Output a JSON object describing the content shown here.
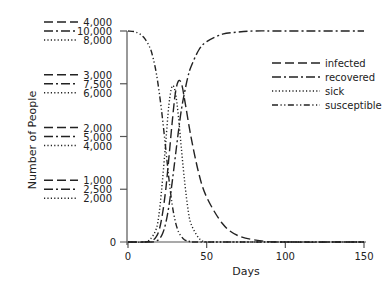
{
  "chart_data": {
    "type": "line",
    "title": "",
    "xlabel": "Days",
    "ylabel": "Number of People",
    "xlim": [
      0,
      150
    ],
    "x_ticks": [
      0,
      50,
      100,
      150
    ],
    "grid": false,
    "legend_position": "upper right (inside plot)",
    "y_scales": [
      {
        "series": "infected",
        "ticks": [
          "0",
          "1,000",
          "2,000",
          "3,000",
          "4,000"
        ],
        "max": 4000
      },
      {
        "series": "recovered / susceptible",
        "ticks": [
          "0",
          "2,500",
          "5,000",
          "7,500",
          "10,000"
        ],
        "max": 10000
      },
      {
        "series": "sick",
        "ticks": [
          "0",
          "2,000",
          "4,000",
          "6,000",
          "8,000"
        ],
        "max": 8000
      }
    ],
    "y_tick_groups": [
      {
        "infected": "4,000",
        "recovered_susceptible": "10,000",
        "sick": "8,000"
      },
      {
        "infected": "3,000",
        "recovered_susceptible": "7,500",
        "sick": "6,000"
      },
      {
        "infected": "2,000",
        "recovered_susceptible": "5,000",
        "sick": "4,000"
      },
      {
        "infected": "1,000",
        "recovered_susceptible": "2,500",
        "sick": "2,000"
      }
    ],
    "zero_label": "0",
    "series": [
      {
        "name": "infected",
        "style": "long-dash",
        "scale_max": 4000,
        "x": [
          0,
          10,
          15,
          18,
          20,
          22,
          24,
          26,
          28,
          30,
          32,
          34,
          36,
          40,
          45,
          50,
          60,
          70,
          85,
          100,
          150
        ],
        "values": [
          0,
          0,
          20,
          100,
          250,
          550,
          1000,
          1600,
          2250,
          2800,
          3050,
          3000,
          2700,
          2000,
          1300,
          850,
          350,
          120,
          20,
          0,
          0
        ]
      },
      {
        "name": "recovered",
        "style": "dash-dot",
        "scale_max": 10000,
        "x": [
          0,
          15,
          18,
          20,
          22,
          24,
          26,
          28,
          30,
          32,
          34,
          36,
          38,
          40,
          45,
          50,
          60,
          70,
          80,
          100,
          150
        ],
        "values": [
          0,
          0,
          50,
          150,
          400,
          900,
          1700,
          2800,
          4000,
          5200,
          6300,
          7100,
          7800,
          8300,
          9100,
          9500,
          9850,
          9950,
          10000,
          10000,
          10000
        ]
      },
      {
        "name": "sick",
        "style": "dotted",
        "scale_max": 8000,
        "x": [
          0,
          10,
          14,
          18,
          20,
          22,
          24,
          26,
          28,
          30,
          32,
          34,
          36,
          38,
          40,
          45,
          50,
          60,
          150
        ],
        "values": [
          0,
          0,
          100,
          500,
          1200,
          2400,
          3800,
          5200,
          5900,
          5700,
          4800,
          3500,
          2300,
          1300,
          700,
          150,
          0,
          0,
          0
        ]
      },
      {
        "name": "susceptible",
        "style": "dash-dot-dot",
        "scale_max": 10000,
        "x": [
          0,
          5,
          10,
          14,
          16,
          18,
          20,
          22,
          24,
          26,
          28,
          30,
          32,
          34,
          36,
          40,
          50,
          150
        ],
        "values": [
          10000,
          9950,
          9700,
          9200,
          8700,
          8000,
          7000,
          5800,
          4400,
          3000,
          1800,
          1000,
          500,
          250,
          100,
          20,
          0,
          0
        ]
      }
    ]
  },
  "legend": {
    "items": [
      {
        "label": "infected",
        "style": "long-dash"
      },
      {
        "label": "recovered",
        "style": "dash-dot"
      },
      {
        "label": "sick",
        "style": "dotted"
      },
      {
        "label": "susceptible",
        "style": "dash-dot-dot"
      }
    ]
  },
  "axes": {
    "xlabel": "Days",
    "ylabel": "Number of People",
    "x_tick_labels": [
      "0",
      "50",
      "100",
      "150"
    ],
    "zero_label": "0"
  },
  "colors": {
    "line": "#222222",
    "axis": "#555555",
    "background": "#ffffff"
  }
}
